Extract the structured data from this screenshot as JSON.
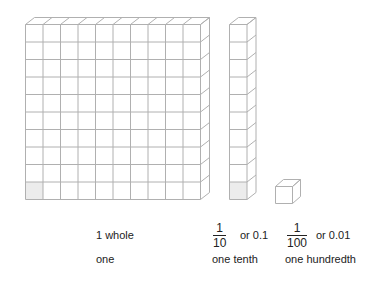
{
  "diagram": {
    "colors": {
      "line": "#b0b0b0",
      "shaded": "#ececec",
      "text": "#222222"
    },
    "blocks": [
      {
        "id": "whole",
        "rows": 10,
        "cols": 10,
        "shaded_cell": "bottom-left"
      },
      {
        "id": "tenth",
        "rows": 10,
        "cols": 1,
        "shaded_cell": "bottom"
      },
      {
        "id": "hundredth",
        "rows": 1,
        "cols": 1,
        "shaded_cell": null
      }
    ],
    "labels": {
      "whole": {
        "value": "1 whole",
        "word": "one"
      },
      "tenth": {
        "numerator": "1",
        "denominator": "10",
        "decimal": "or 0.1",
        "word": "one tenth"
      },
      "hundredth": {
        "numerator": "1",
        "denominator": "100",
        "decimal": "or 0.01",
        "word": "one hundredth"
      }
    }
  }
}
